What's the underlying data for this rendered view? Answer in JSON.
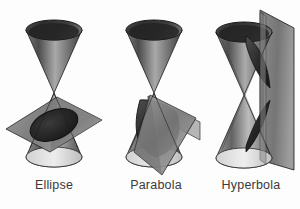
{
  "figure": {
    "background_color": "#fdfdfd",
    "panels": [
      {
        "id": "ellipse",
        "caption": "Ellipse",
        "cut_shape": "ellipse",
        "plane_orientation": "oblique-shallow",
        "description": "Double cone cut by an oblique plane producing a closed elliptical section"
      },
      {
        "id": "parabola",
        "caption": "Parabola",
        "cut_shape": "parabola",
        "plane_orientation": "oblique-parallel-to-side",
        "description": "Double cone cut by a plane parallel to a generating line producing a parabolic section"
      },
      {
        "id": "hyperbola",
        "caption": "Hyperbola",
        "cut_shape": "hyperbola",
        "plane_orientation": "vertical",
        "description": "Double cone cut by a vertical plane producing a two-branch hyperbolic section"
      }
    ]
  },
  "colors": {
    "background": "#fdfdfd",
    "cone_interior_dark": "#2b2b2b",
    "cone_surface_mid": "#7d7d7d",
    "cone_surface_light": "#c9c9c9",
    "plane_gray": "#808080",
    "plane_gray_light": "#b0b0b0",
    "outline": "#1d1d1d",
    "caption_text": "#3a3a3a"
  }
}
